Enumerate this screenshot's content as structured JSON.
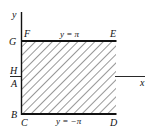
{
  "diagram": {
    "type": "region-in-xy-plane",
    "axes": {
      "x_label": "x",
      "y_label": "y"
    },
    "region": {
      "shading": "diagonal-hatch",
      "top_boundary_label": "y = π",
      "bottom_boundary_label": "y = −π"
    },
    "points": {
      "G": "G",
      "F": "F",
      "E": "E",
      "H": "H",
      "A": "A",
      "B": "B",
      "C": "C",
      "D": "D"
    },
    "colors": {
      "ink": "#111111",
      "background": "#ffffff"
    }
  }
}
